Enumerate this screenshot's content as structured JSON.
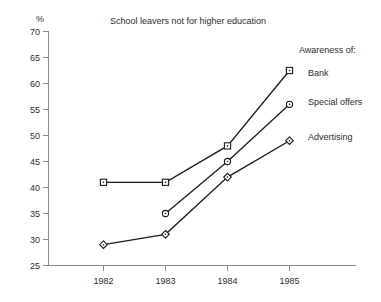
{
  "chart_data": {
    "type": "line",
    "title": "School leavers not for higher education",
    "xlabel": "",
    "ylabel": "%",
    "categories": [
      "1982",
      "1983",
      "1984",
      "1985"
    ],
    "x": [
      1982,
      1983,
      1984,
      1985
    ],
    "ylim": [
      25,
      70
    ],
    "yticks": [
      25,
      30,
      35,
      40,
      45,
      50,
      55,
      60,
      65,
      70
    ],
    "ytick_labels": [
      "25",
      "30",
      "35",
      "40",
      "45",
      "50",
      "55",
      "60",
      "65",
      "70"
    ],
    "xtick_labels": [
      "1982",
      "1983",
      "1984",
      "1985"
    ],
    "grid": false,
    "legend_position": "right-inline",
    "legend_title": "Awareness of:",
    "series": [
      {
        "name": "Bank",
        "marker": "square",
        "values": [
          41,
          41,
          48,
          62.5
        ]
      },
      {
        "name": "Special offers",
        "marker": "circle",
        "values": [
          null,
          35,
          45,
          56
        ]
      },
      {
        "name": "Advertising",
        "marker": "diamond",
        "values": [
          29,
          31,
          42,
          49
        ]
      }
    ],
    "colors": {
      "line": "#1a1a1a",
      "axis": "#8a8a8a",
      "text": "#2b2b2b",
      "background": "#ffffff"
    }
  },
  "labels": {
    "title": "School leavers not for higher education",
    "y_unit": "%",
    "legend_title": "Awareness of:",
    "legend_bank": "Bank",
    "legend_special_offers": "Special offers",
    "legend_advertising": "Advertising",
    "ytick_70": "70",
    "ytick_65": "65",
    "ytick_60": "60",
    "ytick_55": "55",
    "ytick_50": "50",
    "ytick_45": "45",
    "ytick_40": "40",
    "ytick_35": "35",
    "ytick_30": "30",
    "ytick_25": "25",
    "xtick_1982": "1982",
    "xtick_1983": "1983",
    "xtick_1984": "1984",
    "xtick_1985": "1985"
  }
}
